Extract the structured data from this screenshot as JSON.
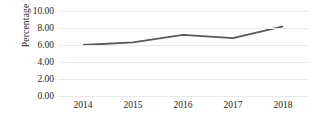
{
  "chart_data": {
    "type": "line",
    "title": "",
    "xlabel": "",
    "ylabel": "Percentage Rate",
    "categories": [
      "2014",
      "2015",
      "2016",
      "2017",
      "2018"
    ],
    "values": [
      6.0,
      6.3,
      7.2,
      6.8,
      8.2
    ],
    "series": [
      {
        "name": "Percentage Rate",
        "values": [
          6.0,
          6.3,
          7.2,
          6.8,
          8.2
        ],
        "color": "#595959"
      }
    ],
    "ylim": [
      0,
      10
    ],
    "ytick_step": 2,
    "ytick_labels": [
      "0.00",
      "2.00",
      "4.00",
      "6.00",
      "8.00",
      "10.00"
    ],
    "ytick_values": [
      0,
      2,
      4,
      6,
      8,
      10
    ],
    "xtick_labels": [
      "2014",
      "2015",
      "2016",
      "2017",
      "2018"
    ],
    "grid": "horizontal",
    "gridline_color": "#e8e8e8",
    "legend": "none",
    "markers": "none",
    "line_color": "#595959",
    "line_width": 1.8,
    "background_color": "#ffffff",
    "text_color": "#262626"
  }
}
